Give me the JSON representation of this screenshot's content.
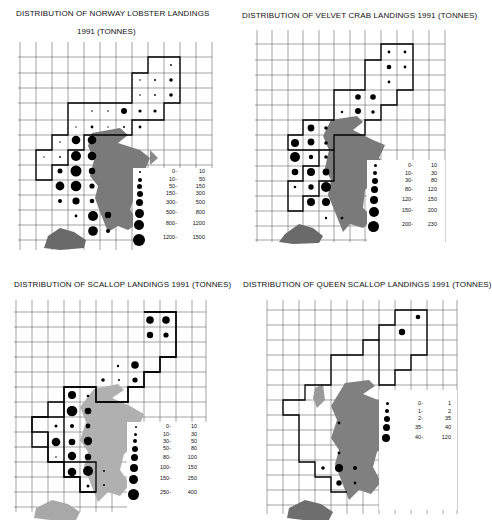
{
  "panels": [
    {
      "id": "norway-lobster",
      "title_line1": "DISTRIBUTION OF NORWAY LOBSTER LANDINGS",
      "title_line2": "1991 (TONNES)",
      "legend": [
        {
          "lo": "0-",
          "hi": "10",
          "r": 1.2
        },
        {
          "lo": "10-",
          "hi": "50",
          "r": 1.8
        },
        {
          "lo": "50-",
          "hi": "150",
          "r": 2.4
        },
        {
          "lo": "150-",
          "hi": "300",
          "r": 3.0
        },
        {
          "lo": "300-",
          "hi": "500",
          "r": 3.6
        },
        {
          "lo": "500-",
          "hi": "800",
          "r": 4.3
        },
        {
          "lo": "800-",
          "hi": "1200",
          "r": 5.0
        },
        {
          "lo": "1200-",
          "hi": "1500",
          "r": 5.8
        }
      ]
    },
    {
      "id": "velvet-crab",
      "title_line1": "DISTRIBUTION OF VELVET CRAB LANDINGS 1991 (TONNES)",
      "legend": [
        {
          "lo": "0-",
          "hi": "10",
          "r": 1.4
        },
        {
          "lo": "10-",
          "hi": "30",
          "r": 2.0
        },
        {
          "lo": "30-",
          "hi": "80",
          "r": 2.7
        },
        {
          "lo": "80-",
          "hi": "120",
          "r": 3.4
        },
        {
          "lo": "120-",
          "hi": "150",
          "r": 4.0
        },
        {
          "lo": "150-",
          "hi": "200",
          "r": 4.7
        },
        {
          "lo": "200-",
          "hi": "230",
          "r": 5.5
        }
      ]
    },
    {
      "id": "scallop",
      "title_line1": "DISTRIBUTION OF SCALLOP LANDINGS 1991 (TONNES)",
      "legend": [
        {
          "lo": "0-",
          "hi": "10",
          "r": 0.8
        },
        {
          "lo": "10-",
          "hi": "30",
          "r": 1.5
        },
        {
          "lo": "30-",
          "hi": "50",
          "r": 2.0
        },
        {
          "lo": "50-",
          "hi": "80",
          "r": 2.7
        },
        {
          "lo": "80-",
          "hi": "100",
          "r": 3.3
        },
        {
          "lo": "100-",
          "hi": "150",
          "r": 3.9
        },
        {
          "lo": "150-",
          "hi": "250",
          "r": 4.5
        },
        {
          "lo": "250-",
          "hi": "400",
          "r": 5.4
        }
      ]
    },
    {
      "id": "queen-scallop",
      "title_line1": "DISTRIBUTION OF QUEEN SCALLOP LANDINGS 1991 (TONNES)",
      "legend": [
        {
          "lo": "0-",
          "hi": "1",
          "r": 1.3
        },
        {
          "lo": "1-",
          "hi": "2",
          "r": 1.9
        },
        {
          "lo": "2-",
          "hi": "35",
          "r": 2.6
        },
        {
          "lo": "35-",
          "hi": "40",
          "r": 3.3
        },
        {
          "lo": "40-",
          "hi": "120",
          "r": 4.0
        }
      ]
    }
  ],
  "colors": {
    "ink": "#111111",
    "grid": "#555555",
    "land_dark": "#6e6e6e",
    "land_light": "#b8b8b8",
    "paper": "#ffffff"
  }
}
